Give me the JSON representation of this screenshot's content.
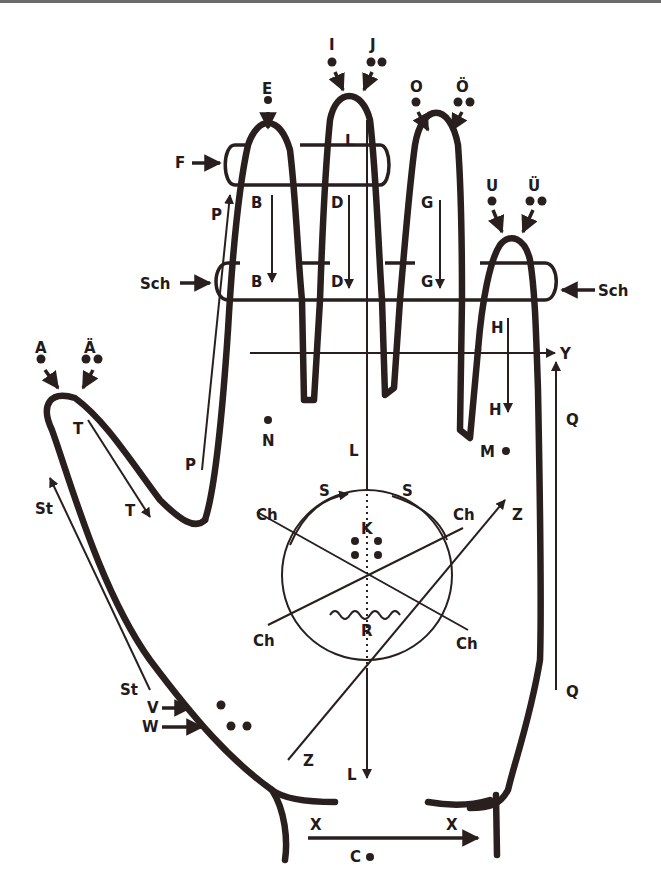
{
  "diagram": {
    "colors": {
      "ink": "#2a1f1f",
      "background": "#ffffff",
      "border": "#6b6b6b"
    },
    "labels": {
      "A": "A",
      "AE": "Ä",
      "B": "B",
      "C": "C",
      "Ch": "Ch",
      "D": "D",
      "E": "E",
      "F": "F",
      "G": "G",
      "H": "H",
      "I": "I",
      "J": "J",
      "K": "K",
      "L": "L",
      "M": "M",
      "N": "N",
      "O": "O",
      "OE": "Ö",
      "P": "P",
      "Q": "Q",
      "R": "R",
      "S": "S",
      "Sch": "Sch",
      "St": "St",
      "T": "T",
      "U": "U",
      "UE": "Ü",
      "V": "V",
      "W": "W",
      "X": "X",
      "Y": "Y",
      "Z": "Z"
    },
    "legend_semantics": {
      "single_dot": "tap once",
      "double_dot": "tap twice",
      "arrow_line": "stroke in direction",
      "ring": "encircle finger",
      "wavy_line": "tremble/roll"
    }
  }
}
